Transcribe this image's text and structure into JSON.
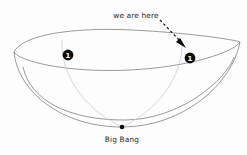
{
  "diagram": {
    "background_color": "#fdfdfd",
    "outline_color": "#6e6e6e",
    "worldline_color": "#c9c9c9",
    "marker_color": "#0d0d0d",
    "text_color": "#2b2b2b"
  },
  "labels": {
    "we_are_here": "we are here",
    "big_bang": "Big Bang"
  },
  "markers": [
    {
      "id": "observer-left",
      "number": "1",
      "x": 68,
      "y": 55
    },
    {
      "id": "observer-right",
      "number": "1",
      "x": 190,
      "y": 58
    }
  ],
  "origin_point": {
    "id": "big-bang-point",
    "label": "Big Bang",
    "x": 122,
    "y": 127
  },
  "annotation_arrow": {
    "id": "we-are-here-arrow",
    "style": "dashed",
    "from_x": 160,
    "from_y": 20,
    "to_x": 185,
    "to_y": 47
  },
  "geometry": {
    "rim_left_x": 14,
    "rim_left_y": 52,
    "rim_right_x": 240,
    "rim_right_y": 42,
    "rim_top_y": 30,
    "bowl_bottom_y": 127
  }
}
